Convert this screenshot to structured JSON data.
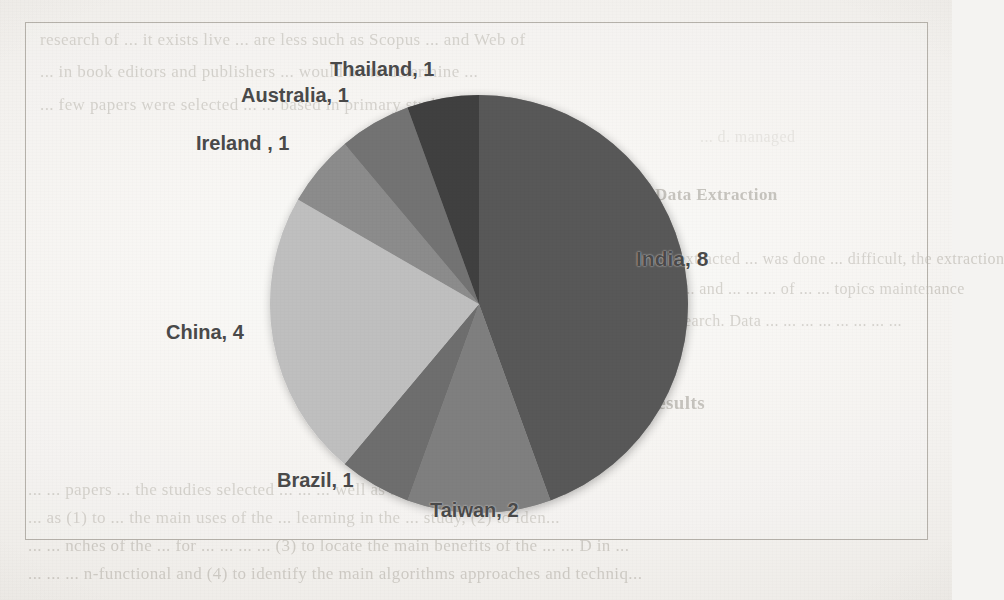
{
  "document": {
    "type": "scanned-page-figure",
    "frame_border_color": "#b5b1aa",
    "page_background_color": "#f4f3f1"
  },
  "chart_data": {
    "type": "pie",
    "title": "",
    "subtitle": "",
    "xlabel": "",
    "ylabel": "",
    "total": 18,
    "legend_position": "none",
    "grid": false,
    "label_format": "{category}, {value}",
    "start_angle_deg": 0,
    "direction": "clockwise",
    "categories": [
      "India",
      "Taiwan",
      "Brazil",
      "China",
      "Ireland ",
      "Australia",
      "Thailand"
    ],
    "values": [
      8,
      2,
      1,
      4,
      1,
      1,
      1
    ],
    "colors": [
      "#595959",
      "#7f7f7f",
      "#6e6e6e",
      "#bfbfbf",
      "#8c8c8c",
      "#737373",
      "#3f3f3f"
    ],
    "slices": [
      {
        "label": "India, 8",
        "category": "India",
        "value": 8,
        "color": "#595959",
        "start_deg": 0,
        "end_deg": 160
      },
      {
        "label": "Taiwan, 2",
        "category": "Taiwan",
        "value": 2,
        "color": "#7f7f7f",
        "start_deg": 160,
        "end_deg": 200
      },
      {
        "label": "Brazil, 1",
        "category": "Brazil",
        "value": 1,
        "color": "#6e6e6e",
        "start_deg": 200,
        "end_deg": 220
      },
      {
        "label": "China, 4",
        "category": "China",
        "value": 4,
        "color": "#bfbfbf",
        "start_deg": 220,
        "end_deg": 300
      },
      {
        "label": "Ireland , 1",
        "category": "Ireland ",
        "value": 1,
        "color": "#8c8c8c",
        "start_deg": 300,
        "end_deg": 320
      },
      {
        "label": "Australia, 1",
        "category": "Australia",
        "value": 1,
        "color": "#737373",
        "start_deg": 320,
        "end_deg": 340
      },
      {
        "label": "Thailand, 1",
        "category": "Thailand",
        "value": 1,
        "color": "#3f3f3f",
        "start_deg": 340,
        "end_deg": 360
      }
    ]
  },
  "labels": {
    "india": "India, 8",
    "taiwan": "Taiwan, 2",
    "brazil": "Brazil, 1",
    "china": "China, 4",
    "ireland": "Ireland , 1",
    "australia": "Australia, 1",
    "thailand": "Thailand, 1"
  },
  "background_text": {
    "above": [
      "research  of  ...  it  exists  live  ...  are  less  such  as  Scopus  ...  and  Web  of",
      "...  in  book  editors  and  publishers  ...  would  be  to  determine  ...",
      "...  few  papers  were  selected  ...  ...  based  in  primary  study  ...  this"
    ],
    "above_right": [
      "... d. managed"
    ],
    "mid_right": [
      "2.4    Data Extraction",
      "...  data  extracted  ...  was  done  ...  difficult,  the  extraction",
      "...  ...  of  ...  and  ...  ...  ...  of  ...  ...  topics  maintenance",
      "... of  research.  Data  ...  ...  ...  ...  ...  ...  ...  ..."
    ],
    "mid_right_heading": "3      Results",
    "below": [
      "...  ...  papers  ...  the  studies  selected  ...  ...  ...  well  as  ...  ...  ...  with  others.  ...  d.",
      "...  as  (1)  to  ...  the  main  uses  of  the  ...  learning  in  the  ...  study,  (2)  to  iden...",
      "...  ...  nches  of  the  ...  for  ...  ...  ...  ...  (3)  to  locate  the  main  benefits  of  the  ...  ...  D  in  ...",
      "...  ...  ...  n-functional  and  (4)  to  identify  the  main  algorithms  approaches  and  techniq..."
    ]
  }
}
